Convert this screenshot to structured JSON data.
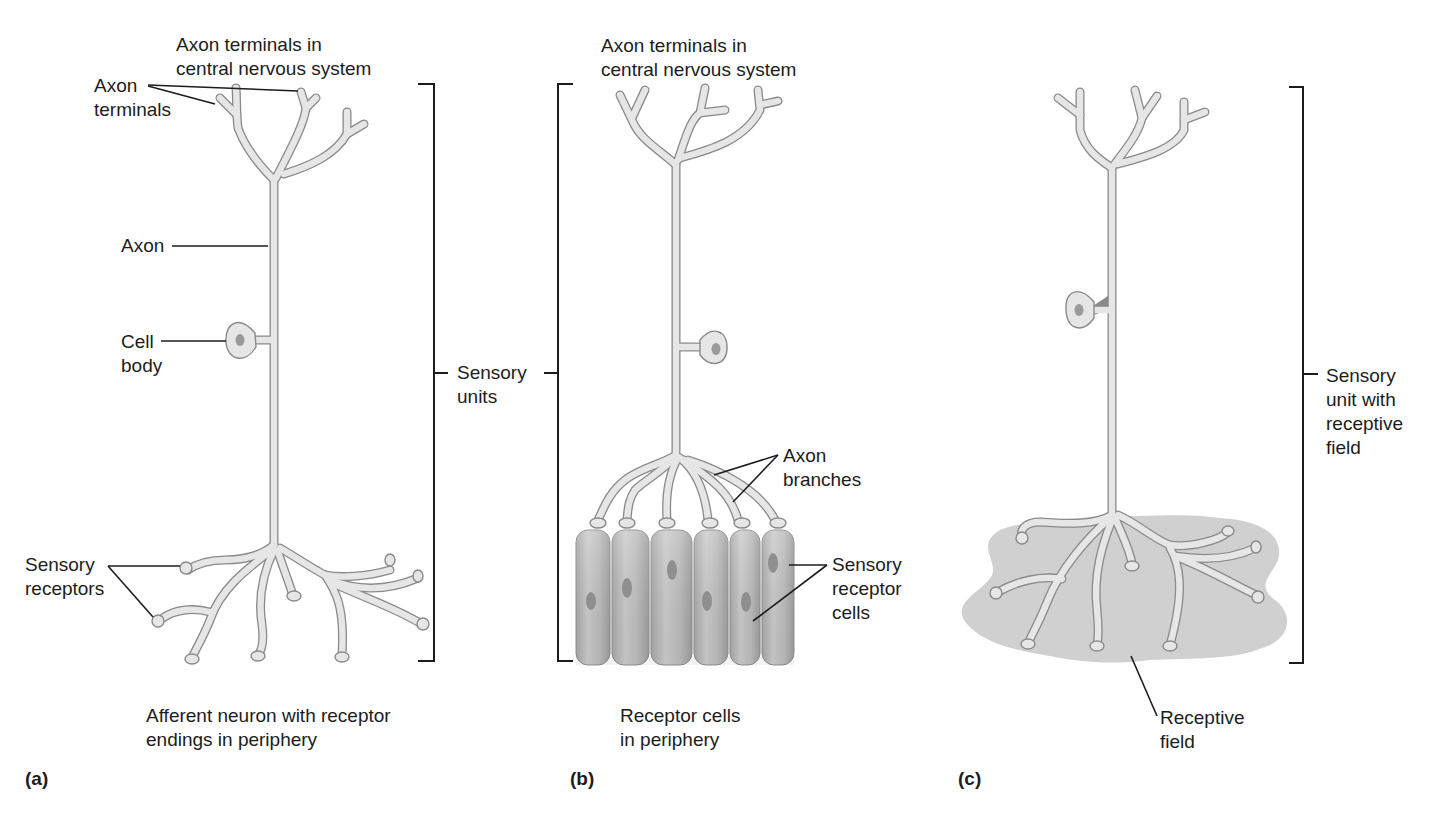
{
  "figure": {
    "panels": [
      {
        "id": "a",
        "letter": "(a)",
        "caption_line1": "Afferent neuron with receptor",
        "caption_line2": "endings in periphery",
        "labels": {
          "top_line1": "Axon terminals in",
          "top_line2": "central nervous system",
          "axon_terminals_line1": "Axon",
          "axon_terminals_line2": "terminals",
          "axon": "Axon",
          "cell_body_line1": "Cell",
          "cell_body_line2": "body",
          "sensory_receptors_line1": "Sensory",
          "sensory_receptors_line2": "receptors"
        }
      },
      {
        "id": "b",
        "letter": "(b)",
        "caption_line1": "Receptor cells",
        "caption_line2": "in periphery",
        "labels": {
          "top_line1": "Axon terminals in",
          "top_line2": "central nervous system",
          "axon_branches_line1": "Axon",
          "axon_branches_line2": "branches",
          "receptor_cells_line1": "Sensory",
          "receptor_cells_line2": "receptor",
          "receptor_cells_line3": "cells"
        },
        "receptor_cell_count": 6
      },
      {
        "id": "c",
        "letter": "(c)",
        "labels": {
          "receptive_field_line1": "Receptive",
          "receptive_field_line2": "field",
          "unit_line1": "Sensory",
          "unit_line2": "unit with",
          "unit_line3": "receptive",
          "unit_line4": "field"
        }
      }
    ],
    "shared_bracket_label_line1": "Sensory",
    "shared_bracket_label_line2": "units",
    "colors": {
      "neuron_fill": "#e6e6e6",
      "neuron_outline": "#8a8a8a",
      "nucleus": "#9a9a9a",
      "receptor_cell": "#b9b9b9",
      "receptive_field": "#cfcfcf",
      "leader_lines": "#1c1c1c"
    }
  }
}
